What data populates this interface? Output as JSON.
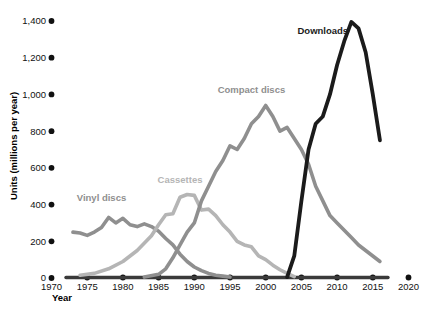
{
  "chart_data": {
    "type": "line",
    "title": "",
    "xlabel": "Year",
    "ylabel": "Units (millions per year)",
    "xlim": [
      1970,
      2020
    ],
    "ylim": [
      0,
      1400
    ],
    "xticks": [
      1970,
      1975,
      1980,
      1985,
      1990,
      1995,
      2000,
      2005,
      2010,
      2015,
      2020
    ],
    "xticklabels": [
      "1970",
      "1975",
      "1980",
      "1985",
      "1990",
      "1995",
      "2000",
      "2005",
      "2010",
      "2015",
      "2020"
    ],
    "yticks": [
      0,
      200,
      400,
      600,
      800,
      1000,
      1200,
      1400
    ],
    "yticklabels": [
      "0",
      "200",
      "400",
      "600",
      "800",
      "1,000",
      "1,200",
      "1,400"
    ],
    "grid": false,
    "legend_position": "inline-annotations",
    "series": [
      {
        "name": "Vinyl discs",
        "color": "#8f8f8f",
        "label_x": 1977,
        "label_y": 420,
        "x": [
          1973,
          1974,
          1975,
          1976,
          1977,
          1978,
          1979,
          1980,
          1981,
          1982,
          1983,
          1984,
          1985,
          1986,
          1987,
          1988,
          1989,
          1990,
          1991,
          1992,
          1993,
          1994,
          1995
        ],
        "y": [
          250,
          245,
          232,
          250,
          275,
          330,
          300,
          325,
          290,
          280,
          295,
          280,
          255,
          215,
          180,
          130,
          90,
          60,
          40,
          25,
          15,
          10,
          5
        ]
      },
      {
        "name": "Cassettes",
        "color": "#b5b5b5",
        "label_x": 1988,
        "label_y": 520,
        "x": [
          1974,
          1976,
          1978,
          1980,
          1982,
          1984,
          1985,
          1986,
          1987,
          1988,
          1989,
          1990,
          1991,
          1992,
          1993,
          1994,
          1995,
          1996,
          1997,
          1998,
          1999,
          2000,
          2001,
          2002,
          2003,
          2004
        ],
        "y": [
          15,
          25,
          50,
          90,
          150,
          230,
          290,
          345,
          350,
          440,
          455,
          450,
          370,
          375,
          340,
          290,
          250,
          200,
          180,
          170,
          120,
          100,
          70,
          45,
          25,
          8
        ]
      },
      {
        "name": "Compact discs",
        "color": "#8f8f8f",
        "label_x": 1998,
        "label_y": 1010,
        "x": [
          1983,
          1985,
          1986,
          1987,
          1988,
          1989,
          1990,
          1991,
          1992,
          1993,
          1994,
          1995,
          1996,
          1997,
          1998,
          1999,
          2000,
          2001,
          2002,
          2003,
          2004,
          2005,
          2006,
          2007,
          2008,
          2009,
          2010,
          2011,
          2012,
          2013,
          2014,
          2015,
          2016
        ],
        "y": [
          5,
          20,
          50,
          110,
          180,
          250,
          300,
          420,
          500,
          580,
          640,
          720,
          700,
          760,
          840,
          880,
          940,
          880,
          800,
          820,
          760,
          700,
          620,
          500,
          420,
          340,
          300,
          260,
          220,
          180,
          150,
          120,
          90
        ]
      },
      {
        "name": "Downloads",
        "color": "#1b1b1b",
        "label_x": 2008,
        "label_y": 1330,
        "x": [
          2003,
          2004,
          2005,
          2006,
          2007,
          2008,
          2009,
          2010,
          2011,
          2012,
          2013,
          2014,
          2015,
          2016
        ],
        "y": [
          5,
          120,
          420,
          700,
          840,
          880,
          1000,
          1160,
          1290,
          1395,
          1360,
          1230,
          1000,
          750
        ]
      }
    ]
  }
}
